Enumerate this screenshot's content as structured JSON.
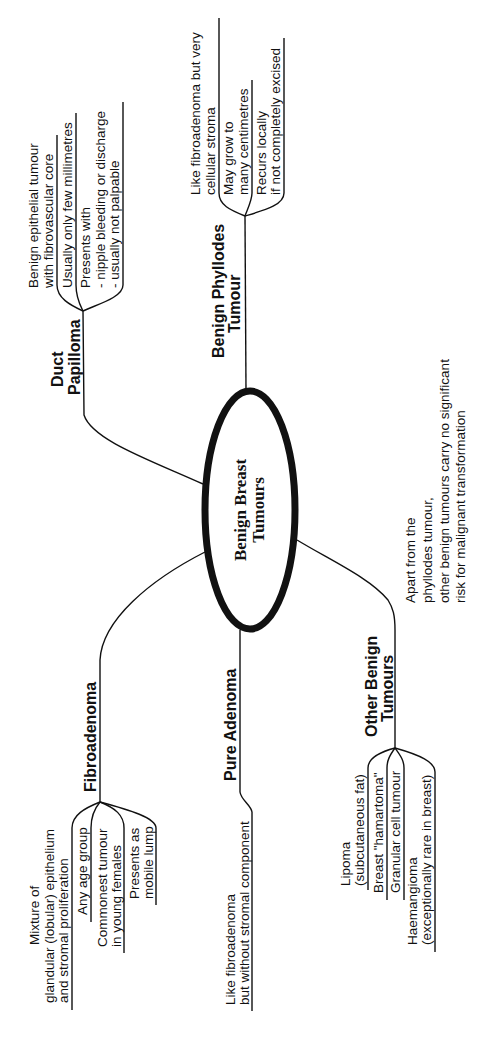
{
  "central": {
    "line1": "Benign Breast",
    "line2": "Tumours"
  },
  "duct_papilloma": {
    "title1": "Duct",
    "title2": "Papilloma",
    "items": [
      {
        "l1": "Benign epithelial tumour",
        "l2": "with fibrovascular core"
      },
      {
        "l1": "Usually only few millimetres"
      },
      {
        "l1": "Presents with",
        "l2": "- nipple bleeding or discharge",
        "l3": "- usually not palpable"
      }
    ]
  },
  "phyllodes": {
    "title1": "Benign Phyllodes",
    "title2": "Tumour",
    "items": [
      {
        "l1": "Like fibroadenoma but very",
        "l2": "cellular stroma"
      },
      {
        "l1": "May grow to",
        "l2": "many centimetres"
      },
      {
        "l1": "Recurs locally",
        "l2": "if not completely excised"
      }
    ]
  },
  "fibroadenoma": {
    "title": "Fibroadenoma",
    "items": [
      {
        "l1": "Mixture of",
        "l2": "glandular (lobular) epithelium",
        "l3": "and stromal proliferation"
      },
      {
        "l1": "Any age group"
      },
      {
        "l1": "Commonest tumour",
        "l2": "in young females"
      },
      {
        "l1": "Presents as",
        "l2": "mobile lump"
      }
    ]
  },
  "pure_adenoma": {
    "title": "Pure Adenoma",
    "items": [
      {
        "l1": "Like fibroadenoma",
        "l2": "but without stromal component"
      }
    ]
  },
  "other_benign": {
    "title1": "Other Benign",
    "title2": "Tumours",
    "items": [
      {
        "l1": "Lipoma",
        "l2": "(subcutaneous fat)"
      },
      {
        "l1": "Breast \"hamartoma\""
      },
      {
        "l1": "Granular cell tumour"
      },
      {
        "l1": "Haemangioma",
        "l2": "(exceptionally rare in breast)"
      }
    ]
  },
  "note": {
    "l1": "Apart from the",
    "l2": "phyllodes tumour,",
    "l3": "other benign tumours carry no significant",
    "l4": "risk for malignant transformation"
  }
}
